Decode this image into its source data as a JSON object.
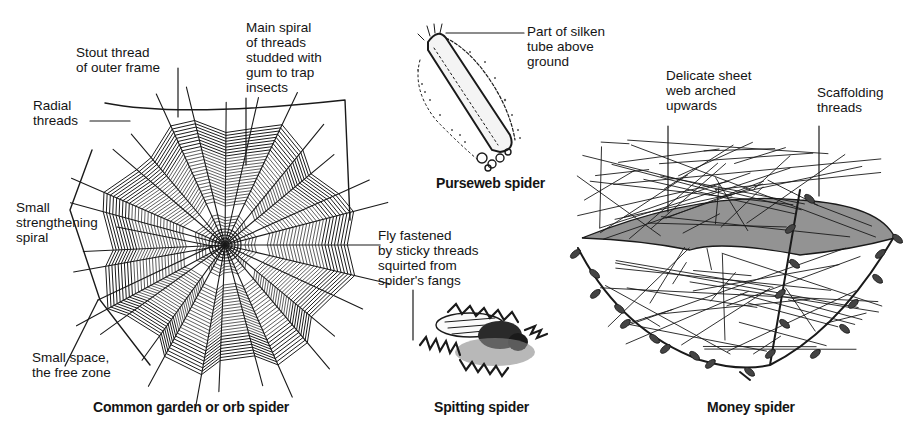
{
  "diagram": {
    "panels": [
      {
        "id": "orb",
        "caption": "Common garden or orb spider",
        "labels": {
          "stout_thread": "Stout thread\nof outer frame",
          "main_spiral": "Main spiral\nof threads\nstudded with\ngum to trap\ninsects",
          "radial": "Radial\nthreads",
          "strengthening": "Small\nstrengthening\nspiral",
          "free_zone": "Small space,\nthe free zone"
        }
      },
      {
        "id": "purseweb",
        "caption": "Purseweb spider",
        "labels": {
          "tube": "Part of silken\ntube above\nground"
        }
      },
      {
        "id": "spitting",
        "caption": "Spitting spider",
        "labels": {
          "fly": "Fly fastened\nby sticky threads\nsquirted from\nspider's fangs"
        }
      },
      {
        "id": "money",
        "caption": "Money spider",
        "labels": {
          "sheet": "Delicate sheet\nweb arched\nupwards",
          "scaffold": "Scaffolding\nthreads"
        }
      }
    ],
    "colors": {
      "ink": "#141414",
      "background": "#ffffff"
    }
  }
}
